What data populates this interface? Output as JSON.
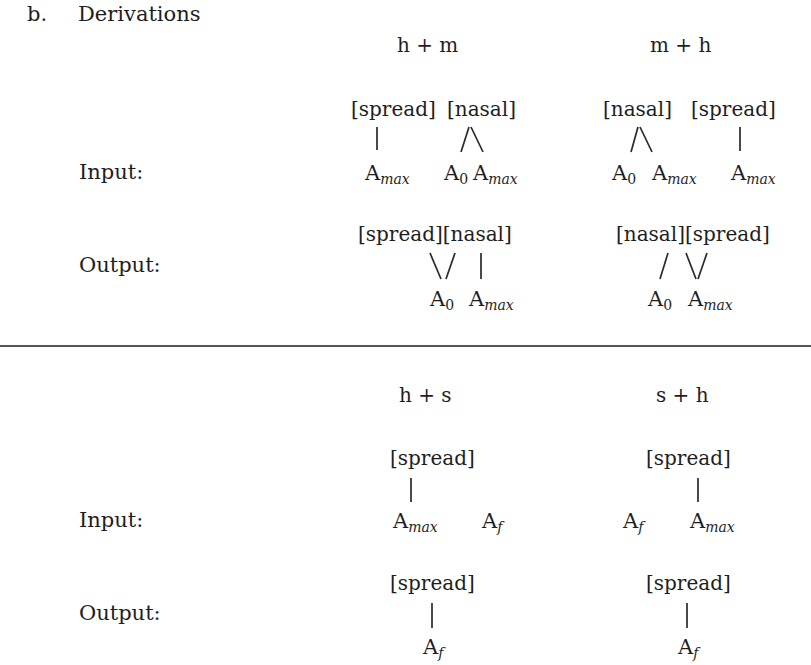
{
  "section": {
    "marker": "b.",
    "title": "Derivations"
  },
  "row_labels": {
    "input": "Input:",
    "output": "Output:"
  },
  "panel1": {
    "columns": [
      {
        "header": "h + m",
        "input": {
          "features": [
            "[spread]",
            "[nasal]"
          ],
          "segments": [
            {
              "base": "A",
              "sub": "max"
            },
            {
              "base": "A",
              "sub": "0"
            },
            {
              "base": "A",
              "sub": "max"
            }
          ]
        },
        "output": {
          "features": [
            "[spread][nasal]"
          ],
          "segments": [
            {
              "base": "A",
              "sub": "0"
            },
            {
              "base": "A",
              "sub": "max"
            }
          ]
        }
      },
      {
        "header": "m + h",
        "input": {
          "features": [
            "[nasal]",
            "[spread]"
          ],
          "segments": [
            {
              "base": "A",
              "sub": "0"
            },
            {
              "base": "A",
              "sub": "max"
            },
            {
              "base": "A",
              "sub": "max"
            }
          ]
        },
        "output": {
          "features": [
            "[nasal][spread]"
          ],
          "segments": [
            {
              "base": "A",
              "sub": "0"
            },
            {
              "base": "A",
              "sub": "max"
            }
          ]
        }
      }
    ]
  },
  "panel2": {
    "columns": [
      {
        "header": "h + s",
        "input": {
          "features": [
            "[spread]"
          ],
          "segments": [
            {
              "base": "A",
              "sub": "max"
            },
            {
              "base": "A",
              "sub": "f"
            }
          ]
        },
        "output": {
          "features": [
            "[spread]"
          ],
          "segments": [
            {
              "base": "A",
              "sub": "f"
            }
          ]
        }
      },
      {
        "header": "s + h",
        "input": {
          "features": [
            "[spread]"
          ],
          "segments": [
            {
              "base": "A",
              "sub": "f"
            },
            {
              "base": "A",
              "sub": "max"
            }
          ]
        },
        "output": {
          "features": [
            "[spread]"
          ],
          "segments": [
            {
              "base": "A",
              "sub": "f"
            }
          ]
        }
      }
    ]
  }
}
